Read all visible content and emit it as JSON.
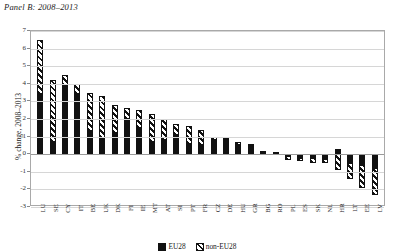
{
  "panel_title": "Panel B: 2008–2013",
  "chart_data": {
    "type": "bar",
    "title": "Panel B: 2008–2013",
    "xlabel": "",
    "ylabel": "% change, 2008–2013",
    "ylim": [
      -3,
      7
    ],
    "yticks": [
      7,
      6,
      5,
      4,
      3,
      2,
      1,
      0,
      -1,
      -2,
      -3
    ],
    "grid": true,
    "stacked": true,
    "legend_position": "bottom",
    "categories": [
      "LU",
      "SE",
      "CY",
      "IT",
      "BE",
      "UK",
      "DK",
      "FI",
      "IE",
      "MT",
      "AT",
      "SI",
      "PT",
      "FR",
      "CZ",
      "DE",
      "HU",
      "GR",
      "BG",
      "RO",
      "PL",
      "ES",
      "SK",
      "NL",
      "HR",
      "LT",
      "EE",
      "LV"
    ],
    "series": [
      {
        "name": "EU28",
        "color": "#111111",
        "pattern": "solid",
        "values": [
          3.4,
          0.7,
          3.9,
          3.4,
          1.3,
          0.9,
          1.2,
          2.0,
          1.5,
          0.7,
          0.8,
          1.1,
          0.6,
          0.5,
          0.8,
          0.8,
          0.5,
          0.5,
          0.2,
          0.1,
          -0.1,
          -0.2,
          -0.2,
          -0.3,
          0.3,
          -0.5,
          -0.6,
          -0.8
        ]
      },
      {
        "name": "non-EU28",
        "color": "#ffffff",
        "pattern": "diagonal-hatch",
        "values": [
          3.1,
          3.5,
          0.6,
          0.6,
          2.2,
          2.4,
          1.6,
          0.6,
          1.0,
          1.6,
          1.2,
          0.6,
          1.0,
          0.9,
          0.2,
          0.1,
          0.2,
          0.1,
          0.0,
          0.0,
          -0.2,
          -0.2,
          -0.3,
          -0.2,
          -0.9,
          -0.9,
          -1.3,
          -1.5
        ]
      }
    ],
    "totals": [
      6.5,
      4.2,
      4.5,
      4.0,
      3.5,
      3.3,
      2.8,
      2.6,
      2.5,
      2.3,
      2.0,
      1.7,
      1.6,
      1.4,
      1.0,
      0.9,
      0.7,
      0.6,
      0.2,
      0.1,
      -0.3,
      -0.4,
      -0.5,
      -0.5,
      -0.6,
      -1.4,
      -1.9,
      -2.3
    ]
  },
  "legend": {
    "items": [
      {
        "label": "EU28"
      },
      {
        "label": "non-EU28"
      }
    ]
  }
}
